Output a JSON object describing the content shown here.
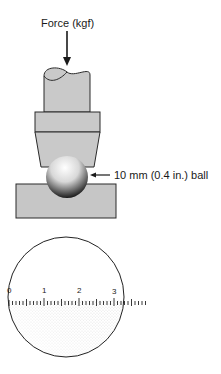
{
  "diagram": {
    "force_label": "Force (kgf)",
    "ball_label": "10 mm (0.4 in.) ball",
    "colors": {
      "indenter_fill": "#c9c9c9",
      "block_fill": "#c6c6c6",
      "outline": "#2a2a2a",
      "ball_highlight": "#ffffff",
      "ball_shadow": "#111111",
      "stipple": "#111111"
    },
    "scale": {
      "tick_labels": [
        "0",
        "1",
        "2",
        "3"
      ],
      "minor_divisions_per_unit": 10,
      "units_visible": 3.9
    },
    "icons": [
      "down-arrow-icon",
      "left-arrow-icon"
    ]
  }
}
